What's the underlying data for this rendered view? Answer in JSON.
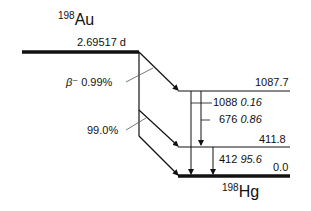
{
  "parent": {
    "mass": "198",
    "symbol": "Au",
    "half_life": "2.69517 d"
  },
  "daughter": {
    "mass": "198",
    "symbol": "Hg"
  },
  "decay_mode": "β⁻",
  "branches": [
    {
      "label_prefix": "β⁻",
      "intensity": "0.99%",
      "to_level": "1087.7"
    },
    {
      "intensity": "99.0%",
      "to_level": "411.8"
    }
  ],
  "levels": [
    {
      "energy": "1087.7"
    },
    {
      "energy": "411.8"
    },
    {
      "energy": "0.0"
    }
  ],
  "gammas": [
    {
      "energy": "1088",
      "intensity": "0.16"
    },
    {
      "energy": "676",
      "intensity": "0.86"
    },
    {
      "energy": "412",
      "intensity": "95.6"
    }
  ],
  "colors": {
    "line": "#111111"
  }
}
